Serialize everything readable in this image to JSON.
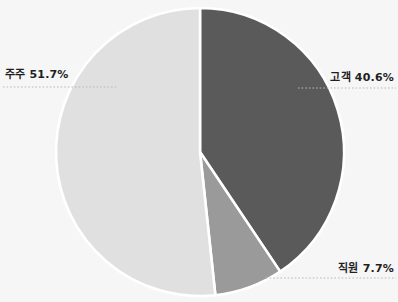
{
  "chart_data": {
    "type": "pie",
    "title": "",
    "subtitle": "",
    "xlabel": "",
    "ylabel": "",
    "grid": false,
    "legend_position": "none",
    "label_format": "{name} {value}%",
    "start_angle_deg": 0,
    "direction": "clockwise",
    "categories": [
      "고객",
      "주주",
      "직원"
    ],
    "values": [
      40.6,
      51.7,
      7.7
    ],
    "slices": [
      {
        "name": "고객",
        "value": 40.6,
        "label": "고객 40.6%",
        "color": "#5a5a5a",
        "start_deg": 0,
        "end_deg": 146.16,
        "leader_side": "right"
      },
      {
        "name": "직원",
        "value": 7.7,
        "label": "직원 7.7%",
        "color": "#9a9a9a",
        "start_deg": 146.16,
        "end_deg": 173.88,
        "leader_side": "right"
      },
      {
        "name": "주주",
        "value": 51.7,
        "label": "주주 51.7%",
        "color": "#e0e0e0",
        "start_deg": 173.88,
        "end_deg": 360,
        "leader_side": "left"
      }
    ]
  },
  "labels": {
    "juju": "주주 51.7%",
    "gogaek": "고객 40.6%",
    "jigwon": "직원 7.7%"
  },
  "colors": {
    "background": "#f6f6f6",
    "slice_gogaek": "#5a5a5a",
    "slice_juju": "#e0e0e0",
    "slice_jigwon": "#9a9a9a",
    "slice_separator": "#ffffff",
    "leader_line": "#b9b9b9",
    "label_text": "#1f1f1f"
  },
  "geometry": {
    "center_x": 200,
    "center_y": 152,
    "radius": 144
  }
}
